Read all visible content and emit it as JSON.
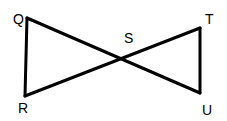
{
  "diagram": {
    "type": "two triangles meeting at a vertex (bowtie)",
    "points": {
      "Q": {
        "label": "Q",
        "x": 27,
        "y": 18
      },
      "R": {
        "label": "R",
        "x": 25,
        "y": 96
      },
      "S": {
        "label": "S",
        "x": 121,
        "y": 59
      },
      "T": {
        "label": "T",
        "x": 200,
        "y": 28
      },
      "U": {
        "label": "U",
        "x": 200,
        "y": 93
      }
    },
    "segments": [
      "QR",
      "QU",
      "RT",
      "TU"
    ],
    "triangles": [
      "QRS",
      "STU"
    ],
    "stroke_color": "#000000"
  }
}
